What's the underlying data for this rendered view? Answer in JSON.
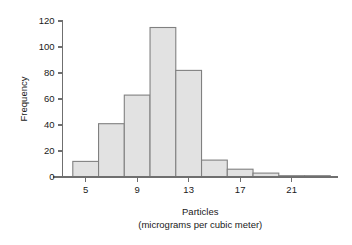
{
  "chart_data": {
    "type": "bar",
    "subtype": "histogram",
    "title": "",
    "xlabel": "Particles",
    "xlabel_sub": "(micrograms per cubic meter)",
    "ylabel": "Frequency",
    "xlim": [
      3.2,
      24.6
    ],
    "ylim": [
      0,
      126
    ],
    "grid": false,
    "legend": null,
    "bin_width": 2,
    "bin_edges": [
      4,
      6,
      8,
      10,
      12,
      14,
      16,
      18,
      20,
      22,
      24
    ],
    "bin_centers": [
      5,
      7,
      9,
      11,
      13,
      15,
      17,
      19,
      21,
      23
    ],
    "categories": [
      "4-6",
      "6-8",
      "8-10",
      "10-12",
      "12-14",
      "14-16",
      "16-18",
      "18-20",
      "20-22",
      "22-24"
    ],
    "values": [
      12,
      41,
      63,
      115,
      82,
      13,
      6,
      3,
      1,
      1
    ],
    "bars": [
      {
        "x0": 4,
        "x1": 6,
        "value": 12
      },
      {
        "x0": 6,
        "x1": 8,
        "value": 41
      },
      {
        "x0": 8,
        "x1": 10,
        "value": 63
      },
      {
        "x0": 10,
        "x1": 12,
        "value": 115
      },
      {
        "x0": 12,
        "x1": 14,
        "value": 82
      },
      {
        "x0": 14,
        "x1": 16,
        "value": 13
      },
      {
        "x0": 16,
        "x1": 18,
        "value": 6
      },
      {
        "x0": 18,
        "x1": 20,
        "value": 3
      },
      {
        "x0": 20,
        "x1": 22,
        "value": 1
      },
      {
        "x0": 22,
        "x1": 24,
        "value": 1
      }
    ],
    "yticks": [
      0,
      20,
      40,
      60,
      80,
      100,
      120
    ],
    "ytick_labels": [
      "0",
      "20",
      "40",
      "60",
      "80",
      "100",
      "120"
    ],
    "xticks": [
      5,
      9,
      13,
      17,
      21
    ],
    "xtick_labels": [
      "5",
      "9",
      "13",
      "17",
      "21"
    ],
    "colors": {
      "bar_fill": "#e2e2e2",
      "bar_stroke": "#808080",
      "axis": "#6f6f6f",
      "text": "#1a1a1a",
      "background": "#ffffff"
    }
  }
}
